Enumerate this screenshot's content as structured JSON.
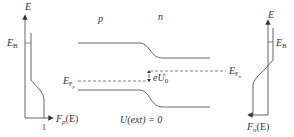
{
  "colors": {
    "line": "#555555",
    "text": "#333333",
    "background": "#ffffff"
  },
  "left_plot": {
    "y_axis_label": "E",
    "level_label_main": "E",
    "level_label_sub": "B",
    "x_axis_label_main": "F",
    "x_axis_label_sub": "p",
    "x_axis_label_arg": "(E)",
    "x_tick": "1"
  },
  "right_plot": {
    "y_axis_label": "E",
    "level_label_main": "E",
    "level_label_sub": "B",
    "x_axis_label_main": "F",
    "x_axis_label_sub": "n",
    "x_axis_label_arg": "(E)"
  },
  "regions": {
    "p": "p",
    "n": "n"
  },
  "fermi_p": {
    "main": "E",
    "sub": "F",
    "subsub": "p"
  },
  "fermi_n": {
    "main": "E",
    "sub": "F",
    "subsub": "n"
  },
  "barrier": {
    "main": "eU",
    "sub": "0"
  },
  "condition": "U(ext) = 0"
}
